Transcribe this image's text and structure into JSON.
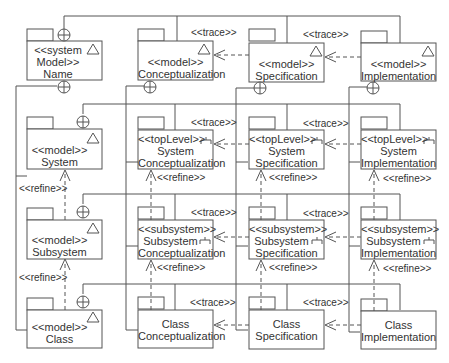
{
  "diagram": {
    "type": "UML package diagram",
    "root": {
      "stereotype": "<<system",
      "stereotype2": "Model>>",
      "name": "Name"
    },
    "top_row": [
      {
        "stereotype": "<<model>>",
        "name": "Conceptualization"
      },
      {
        "stereotype": "<<model>>",
        "name": "Specification"
      },
      {
        "stereotype": "<<model>>",
        "name": "Implementation"
      }
    ],
    "left_column": [
      {
        "stereotype": "<<model>>",
        "name": "System"
      },
      {
        "stereotype": "<<model>>",
        "name": "Subsystem"
      },
      {
        "stereotype": "<<model>>",
        "name": "Class"
      }
    ],
    "system_row": [
      {
        "stereotype": "<<topLevel>>",
        "line1": "System",
        "line2": "Conceptualization"
      },
      {
        "stereotype": "<<topLevel>>",
        "line1": "System",
        "line2": "Specification"
      },
      {
        "stereotype": "<<topLevel>>",
        "line1": "System",
        "line2": "Implementation"
      }
    ],
    "subsystem_row": [
      {
        "stereotype": "<<subsystem>>",
        "line1": "Subsystem",
        "line2": "Conceptualization"
      },
      {
        "stereotype": "<<subsystem>>",
        "line1": "Subsystem",
        "line2": "Specification"
      },
      {
        "stereotype": "<<subsystem>>",
        "line1": "Subsystem",
        "line2": "Implementation"
      }
    ],
    "class_row": [
      {
        "line1": "Class",
        "line2": "Conceptualization"
      },
      {
        "line1": "Class",
        "line2": "Specification"
      },
      {
        "line1": "Class",
        "line2": "Implementation"
      }
    ],
    "labels": {
      "trace": "<<trace>>",
      "refine": "<<refine>>"
    },
    "colors": {
      "line": "#555555",
      "text": "#333333",
      "background": "#ffffff"
    }
  }
}
